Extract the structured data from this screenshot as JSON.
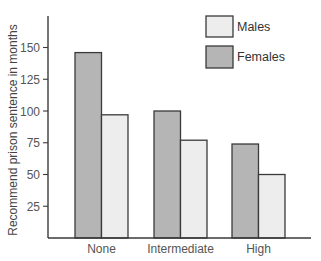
{
  "chart_data": {
    "type": "bar",
    "title": "",
    "xlabel": "",
    "ylabel": "Recommend prison sentence in months",
    "categories": [
      "None",
      "Intermediate",
      "High"
    ],
    "series": [
      {
        "name": "Females",
        "color": "#b5b5b5",
        "values": [
          146,
          100,
          74
        ]
      },
      {
        "name": "Males",
        "color": "#ededed",
        "values": [
          97,
          77,
          50
        ]
      }
    ],
    "yticks": [
      25,
      50,
      75,
      100,
      125,
      150
    ],
    "ylim": [
      0,
      175
    ],
    "grid": false,
    "legend": {
      "position": "top-right",
      "entries": [
        {
          "label": "Males",
          "color": "#ededed"
        },
        {
          "label": "Females",
          "color": "#b5b5b5"
        }
      ]
    }
  }
}
